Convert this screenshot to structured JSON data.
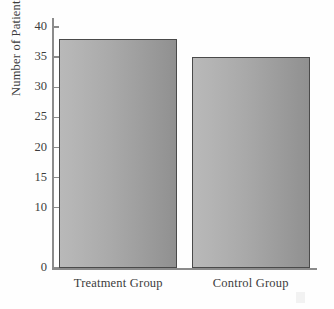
{
  "figure": {
    "background_color": "#ffffff",
    "axis_color": "#8b8b8b",
    "bar_border_color": "#4a4a4a",
    "bar_fill_light": "#b9b9b9",
    "bar_fill_dark": "#909090",
    "text_color": "#3c3c3c"
  },
  "chart_data": {
    "type": "bar",
    "title": "",
    "xlabel": "",
    "ylabel": "Number of Patients",
    "categories": [
      "Treatment Group",
      "Control Group"
    ],
    "values": [
      38,
      35
    ],
    "ylim": [
      0,
      41.5
    ],
    "yticks": [
      0,
      10,
      15,
      20,
      25,
      30,
      35,
      40
    ],
    "ytick_labels": [
      "0",
      "10",
      "15",
      "20",
      "25",
      "30",
      "35",
      "40"
    ],
    "grid": false,
    "legend": null,
    "annotations": []
  }
}
